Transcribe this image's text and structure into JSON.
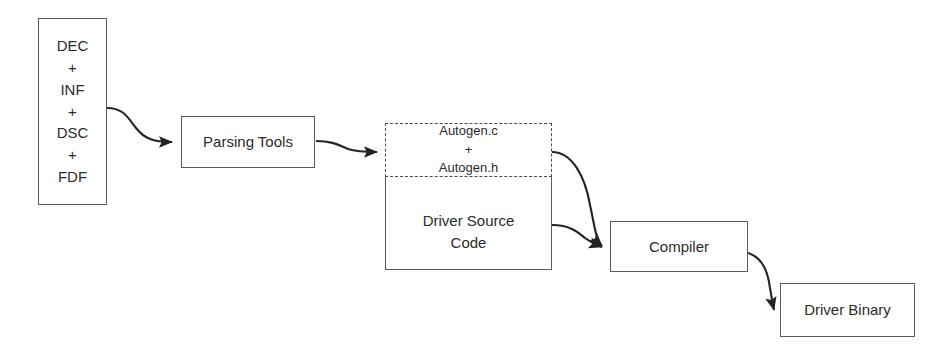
{
  "diagram": {
    "background_color": "#ffffff",
    "line_color": "#232323",
    "text_color": "#2b2b2b",
    "nodes": {
      "inputs": {
        "label": "DEC\n+\nINF\n+\nDSC\n+\nFDF",
        "shape": "rect",
        "border": "solid"
      },
      "parsing_tools": {
        "label": "Parsing Tools",
        "shape": "rect",
        "border": "solid"
      },
      "autogen": {
        "label": "Autogen.c\n+\nAutogen.h",
        "shape": "rect",
        "border": "dashed"
      },
      "driver_source": {
        "label": "Driver Source\nCode",
        "shape": "rect",
        "border": "solid"
      },
      "compiler": {
        "label": "Compiler",
        "shape": "rect",
        "border": "solid"
      },
      "driver_binary": {
        "label": "Driver Binary",
        "shape": "rect",
        "border": "solid"
      }
    },
    "edges": [
      {
        "name": "inputs-to-parsing-tools",
        "from": "inputs",
        "to": "parsing_tools",
        "style": "curved-arrow"
      },
      {
        "name": "parsing-tools-to-autogen",
        "from": "parsing_tools",
        "to": "autogen",
        "style": "curved-arrow"
      },
      {
        "name": "autogen-to-compiler",
        "from": "autogen",
        "to": "compiler",
        "style": "curved-arrow"
      },
      {
        "name": "driver-source-to-compiler",
        "from": "driver_source",
        "to": "compiler",
        "style": "curved-arrow"
      },
      {
        "name": "compiler-to-driver-binary",
        "from": "compiler",
        "to": "driver_binary",
        "style": "curved-arrow"
      }
    ]
  }
}
